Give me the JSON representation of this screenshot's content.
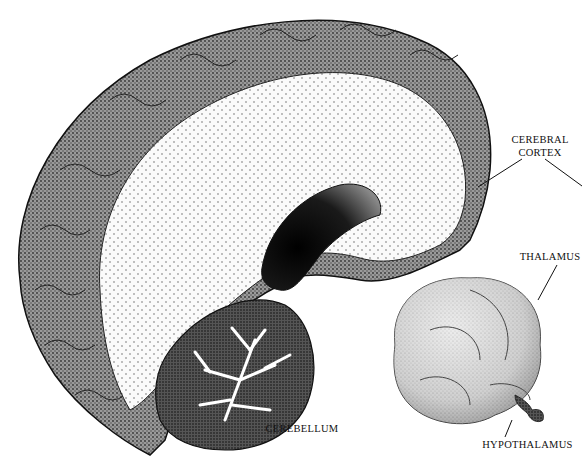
{
  "figure": {
    "labels": {
      "cerebral_cortex_line1": "CEREBRAL",
      "cerebral_cortex_line2": "CORTEX",
      "thalamus": "THALAMUS",
      "cerebellum": "CEREBELLUM",
      "hypothalamus": "HYPOTHALAMUS"
    },
    "structures": [
      "cerebral cortex",
      "white matter",
      "lateral ventricle",
      "cerebellum",
      "thalamus",
      "hypothalamus"
    ],
    "colors": {
      "ink": "#111111",
      "gray_matter": "#7a7a7a",
      "white_matter": "#f4f4f4",
      "ventricle": "#1a1a1a",
      "thalamus_fill": "#cfcfcf"
    }
  }
}
